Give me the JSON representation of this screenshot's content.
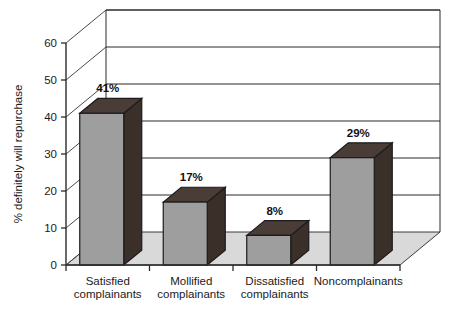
{
  "chart_data": {
    "type": "bar",
    "title": "",
    "subtitle": "",
    "xlabel": "",
    "ylabel": "% definitely will repurchase",
    "categories": [
      "Satisfied complainants",
      "Mollified complainants",
      "Dissatisfied complainants",
      "Noncomplainants"
    ],
    "category_lines": [
      [
        "Satisfied",
        "complainants"
      ],
      [
        "Mollified",
        "complainants"
      ],
      [
        "Dissatisfied",
        "complainants"
      ],
      [
        "Noncomplainants",
        ""
      ]
    ],
    "values": [
      41,
      17,
      8,
      29
    ],
    "data_labels": [
      "41%",
      "17%",
      "8%",
      "29%"
    ],
    "ylim": [
      0,
      60
    ],
    "ytick_values": [
      0,
      10,
      20,
      30,
      40,
      50,
      60
    ],
    "ytick_labels": [
      "0",
      "10",
      "20",
      "30",
      "40",
      "50",
      "60"
    ],
    "grid": true,
    "legend": null,
    "legend_position": "none",
    "style": "3d-column",
    "colors": {
      "bar_front": "#9e9e9e",
      "bar_side": "#3b2f2a",
      "bar_top": "#4a3c36",
      "floor": "#d9d9d9",
      "axis": "#2b2b2b",
      "grid": "#2b2b2b",
      "background": "#ffffff",
      "text": "#1a1a1a"
    }
  }
}
